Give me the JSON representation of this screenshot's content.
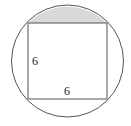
{
  "diagram": {
    "square": {
      "side_left_label": "6",
      "side_bottom_label": "6"
    },
    "colors": {
      "stroke": "#555555",
      "shaded_region": "#d9d9d9",
      "background": "#ffffff"
    }
  }
}
